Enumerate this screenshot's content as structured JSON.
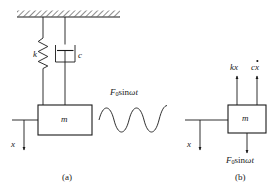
{
  "figure": {
    "stroke_color": "#1a1a1a",
    "background_color": "#ffffff",
    "captions": [
      {
        "id": "caption-a",
        "text": "(a)"
      },
      {
        "id": "caption-b",
        "text": "(b)"
      }
    ]
  },
  "panel_a": {
    "name": "physical-model",
    "caption": "(a)",
    "ceiling": {
      "name": "hatched-ground-support",
      "hatch_angle_deg": 45
    },
    "spring": {
      "label": "k",
      "name": "spring-element"
    },
    "damper": {
      "label": "c",
      "name": "damper-element"
    },
    "mass": {
      "label": "m",
      "name": "mass-block"
    },
    "displacement": {
      "label": "x",
      "direction": "down"
    },
    "excitation": {
      "label_prefix": "F",
      "label_subscript": "0",
      "label_function": "sin",
      "label_argument": "ωt",
      "label_plain": "F0 sin ωt",
      "waveform": "sine"
    }
  },
  "panel_b": {
    "name": "free-body-diagram",
    "caption": "(b)",
    "mass": {
      "label": "m",
      "name": "mass-block"
    },
    "displacement": {
      "label": "x",
      "direction": "down"
    },
    "forces": [
      {
        "name": "spring-force",
        "label_plain": "kx",
        "coefficient": "k",
        "variable": "x",
        "dotted": false,
        "direction": "up"
      },
      {
        "name": "damping-force",
        "label_plain": "cẋ",
        "coefficient": "c",
        "variable": "x",
        "dotted": true,
        "direction": "up"
      },
      {
        "name": "applied-force",
        "label_prefix": "F",
        "label_subscript": "0",
        "label_function": "sin",
        "label_argument": "ωt",
        "label_plain": "F0 sin ωt",
        "direction": "down"
      }
    ]
  }
}
